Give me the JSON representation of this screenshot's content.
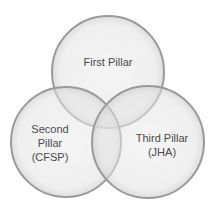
{
  "diagram": {
    "type": "venn",
    "circles": [
      {
        "id": "first",
        "label_lines": [
          "First Pillar"
        ],
        "cx": 108,
        "cy": 72,
        "r": 56
      },
      {
        "id": "second",
        "label_lines": [
          "Second",
          "Pillar",
          "(CFSP)"
        ],
        "cx": 66,
        "cy": 142,
        "r": 55
      },
      {
        "id": "third",
        "label_lines": [
          "Third Pillar",
          "(JHA)"
        ],
        "cx": 148,
        "cy": 142,
        "r": 56
      }
    ],
    "colors": {
      "fill": "#e6e6e6",
      "stroke": "#9a9a9a",
      "text": "#4a4a4a"
    }
  }
}
